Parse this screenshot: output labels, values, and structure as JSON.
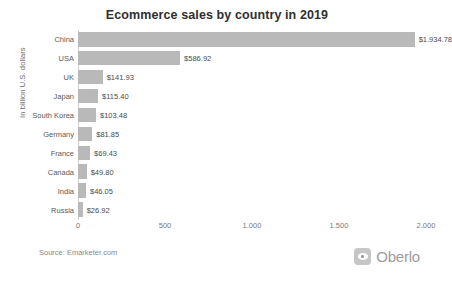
{
  "chart_data": {
    "type": "bar",
    "orientation": "horizontal",
    "title": "Ecommerce sales by country in 2019",
    "xlabel": "",
    "ylabel": "In billion U.S. dollars",
    "xlim": [
      0,
      2000
    ],
    "grid": false,
    "legend": null,
    "categories": [
      "China",
      "USA",
      "UK",
      "Japan",
      "South Korea",
      "Germany",
      "France",
      "Canada",
      "India",
      "Russia"
    ],
    "values": [
      1934.78,
      586.92,
      141.93,
      115.4,
      103.48,
      81.85,
      69.43,
      49.8,
      46.05,
      26.92
    ],
    "value_labels": [
      "$1.934.78",
      "$586.92",
      "$141.93",
      "$115.40",
      "$103.48",
      "$81.85",
      "$69.43",
      "$49.80",
      "$46.05",
      "$26.92"
    ],
    "xticks": [
      0,
      500,
      1000,
      1500,
      2000
    ],
    "xtick_labels": [
      "0",
      "500",
      "1.000",
      "1.500",
      "2.000"
    ],
    "bar_color": "#b9b9b9"
  },
  "footer": {
    "source": "Source: Emarketer.com",
    "brand": "Oberlo"
  }
}
